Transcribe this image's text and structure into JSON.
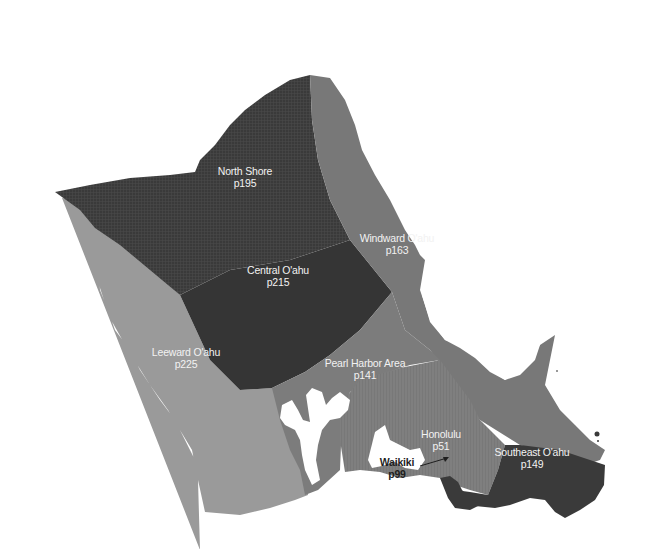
{
  "map": {
    "title": "O'ahu Regions",
    "colors": {
      "background": "#ffffff",
      "dark_region": "#3c3c3c",
      "mid_region": "#777777",
      "light_region": "#9a9a9a",
      "water": "#ffffff",
      "label_light": "#f2f2f2",
      "label_dark": "#1e1e1e"
    },
    "regions": [
      {
        "id": "north-shore",
        "name": "North Shore",
        "page": "p195",
        "shade": "dark"
      },
      {
        "id": "central-oahu",
        "name": "Central O'ahu",
        "page": "p215",
        "shade": "dark"
      },
      {
        "id": "windward-oahu",
        "name": "Windward O'ahu",
        "page": "p163",
        "shade": "mid"
      },
      {
        "id": "leeward-oahu",
        "name": "Leeward O'ahu",
        "page": "p225",
        "shade": "light"
      },
      {
        "id": "pearl-harbor-area",
        "name": "Pearl Harbor Area",
        "page": "p141",
        "shade": "mid"
      },
      {
        "id": "honolulu",
        "name": "Honolulu",
        "page": "p51",
        "shade": "mid-striped"
      },
      {
        "id": "southeast-oahu",
        "name": "Southeast O'ahu",
        "page": "p149",
        "shade": "dark"
      },
      {
        "id": "waikiki",
        "name": "Waikiki",
        "page": "p99",
        "shade": "dark"
      }
    ]
  }
}
